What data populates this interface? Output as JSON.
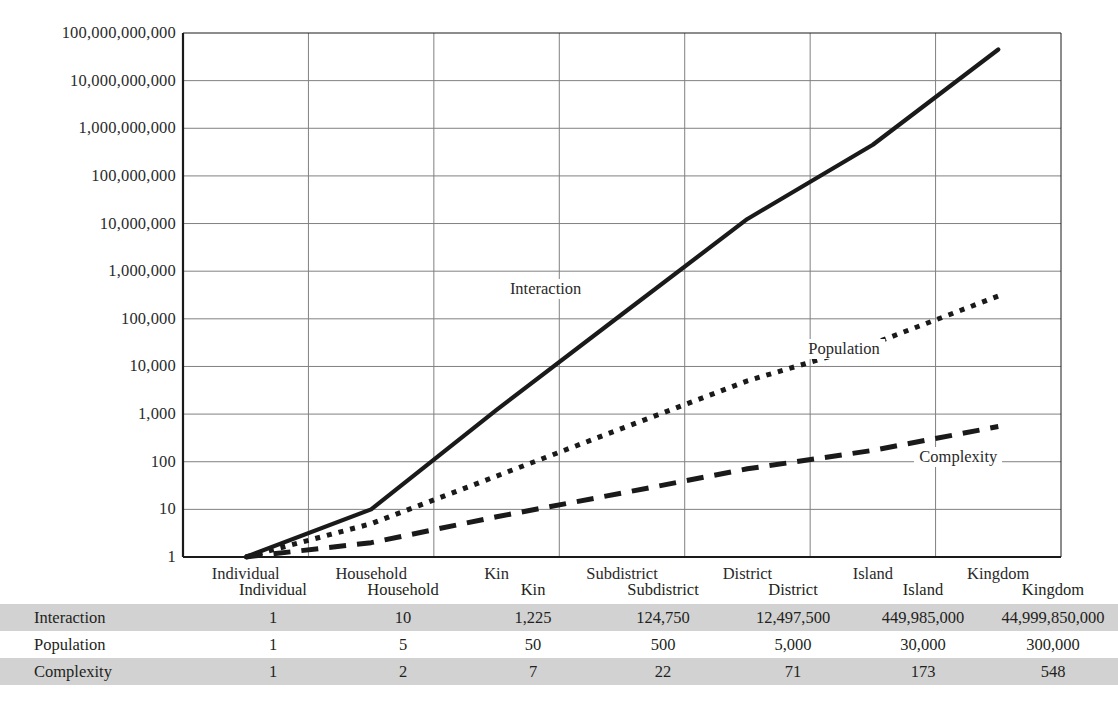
{
  "chart_data": {
    "type": "line",
    "title": "",
    "xlabel": "",
    "ylabel": "",
    "log_scale_y": true,
    "ylim": [
      1,
      100000000000
    ],
    "grid": true,
    "legend_position": "inline-annotations",
    "categories": [
      "Individual",
      "Household",
      "Kin",
      "Subdistrict",
      "District",
      "Island",
      "Kingdom"
    ],
    "ytick_labels": [
      "100,000,000,000",
      "10,000,000,000",
      "1,000,000,000",
      "100,000,000",
      "10,000,000",
      "1,000,000",
      "100,000",
      "10,000",
      "1,000",
      "100",
      "10",
      "1"
    ],
    "ytick_values": [
      100000000000,
      10000000000,
      1000000000,
      100000000,
      10000000,
      1000000,
      100000,
      10000,
      1000,
      100,
      10,
      1
    ],
    "series": [
      {
        "name": "Interaction",
        "style": "solid",
        "values": [
          1,
          10,
          1225,
          124750,
          12497500,
          449985000,
          44999850000
        ],
        "value_labels": [
          "1",
          "10",
          "1,225",
          "124,750",
          "12,497,500",
          "449,985,000",
          "44,999,850,000"
        ]
      },
      {
        "name": "Population",
        "style": "dotted",
        "values": [
          1,
          5,
          50,
          500,
          5000,
          30000,
          300000
        ],
        "value_labels": [
          "1",
          "5",
          "50",
          "500",
          "5,000",
          "30,000",
          "300,000"
        ]
      },
      {
        "name": "Complexity",
        "style": "dashed",
        "values": [
          1,
          2,
          7,
          22,
          71,
          173,
          548
        ],
        "value_labels": [
          "1",
          "2",
          "7",
          "22",
          "71",
          "173",
          "548"
        ]
      }
    ],
    "annotations": [
      {
        "text": "Interaction",
        "x_frac": 0.413,
        "y_frac": 0.489
      },
      {
        "text": "Population",
        "x_frac": 0.753,
        "y_frac": 0.603
      },
      {
        "text": "Complexity",
        "x_frac": 0.883,
        "y_frac": 0.81
      }
    ]
  },
  "table": {
    "column_headers": [
      "Individual",
      "Household",
      "Kin",
      "Subdistrict",
      "District",
      "Island",
      "Kingdom"
    ],
    "rows": [
      {
        "label": "Interaction",
        "shaded": true,
        "values": [
          "1",
          "10",
          "1,225",
          "124,750",
          "12,497,500",
          "449,985,000",
          "44,999,850,000"
        ]
      },
      {
        "label": "Population",
        "shaded": false,
        "values": [
          "1",
          "5",
          "50",
          "500",
          "5,000",
          "30,000",
          "300,000"
        ]
      },
      {
        "label": "Complexity",
        "shaded": true,
        "values": [
          "1",
          "2",
          "7",
          "22",
          "71",
          "173",
          "548"
        ]
      }
    ]
  },
  "colors": {
    "line": "#1a1a1a",
    "grid": "#808080",
    "axis": "#1a1a1a",
    "table_shade": "#d2d2d2",
    "text": "#231f20"
  }
}
